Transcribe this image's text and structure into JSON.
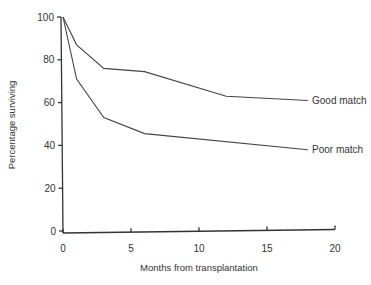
{
  "chart_data": {
    "type": "line",
    "title": "",
    "xlabel": "Months from transplantation",
    "ylabel": "Percentage surviving",
    "xlim": [
      0,
      20
    ],
    "ylim": [
      0,
      100
    ],
    "x_ticks": [
      0,
      5,
      10,
      15,
      20
    ],
    "y_ticks": [
      0,
      20,
      40,
      60,
      80,
      100
    ],
    "grid": false,
    "legend_position": "inline-right",
    "series": [
      {
        "name": "Good match",
        "x": [
          0,
          1,
          3,
          6,
          12,
          18
        ],
        "values": [
          100,
          87,
          76,
          74.5,
          63,
          61
        ]
      },
      {
        "name": "Poor match",
        "x": [
          0,
          1,
          3,
          6,
          18
        ],
        "values": [
          100,
          71,
          53,
          45.5,
          38
        ]
      }
    ]
  },
  "labels": {
    "xlabel": "Months from transplantation",
    "ylabel": "Percentage surviving",
    "x_ticks": [
      "0",
      "5",
      "10",
      "15",
      "20"
    ],
    "y_ticks": [
      "0",
      "20",
      "40",
      "60",
      "80",
      "100"
    ],
    "series_good": "Good match",
    "series_poor": "Poor match"
  }
}
